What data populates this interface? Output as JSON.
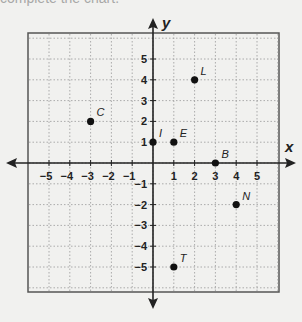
{
  "header": {
    "cut_text": "complete the chart."
  },
  "chart_data": {
    "type": "scatter",
    "title": "",
    "xlabel": "x",
    "ylabel": "y",
    "xlim": [
      -6,
      6
    ],
    "ylim": [
      -6,
      6
    ],
    "grid": true,
    "x_ticks": [
      -5,
      -4,
      -3,
      -2,
      -1,
      1,
      2,
      3,
      4,
      5
    ],
    "y_ticks": [
      -5,
      -4,
      -3,
      -2,
      -1,
      1,
      2,
      3,
      4,
      5
    ],
    "points": [
      {
        "label": "C",
        "x": -3,
        "y": 2
      },
      {
        "label": "I",
        "x": 0,
        "y": 1
      },
      {
        "label": "E",
        "x": 1,
        "y": 1
      },
      {
        "label": "L",
        "x": 2,
        "y": 4
      },
      {
        "label": "B",
        "x": 3,
        "y": 0
      },
      {
        "label": "N",
        "x": 4,
        "y": -2
      },
      {
        "label": "T",
        "x": 1,
        "y": -5
      }
    ]
  }
}
